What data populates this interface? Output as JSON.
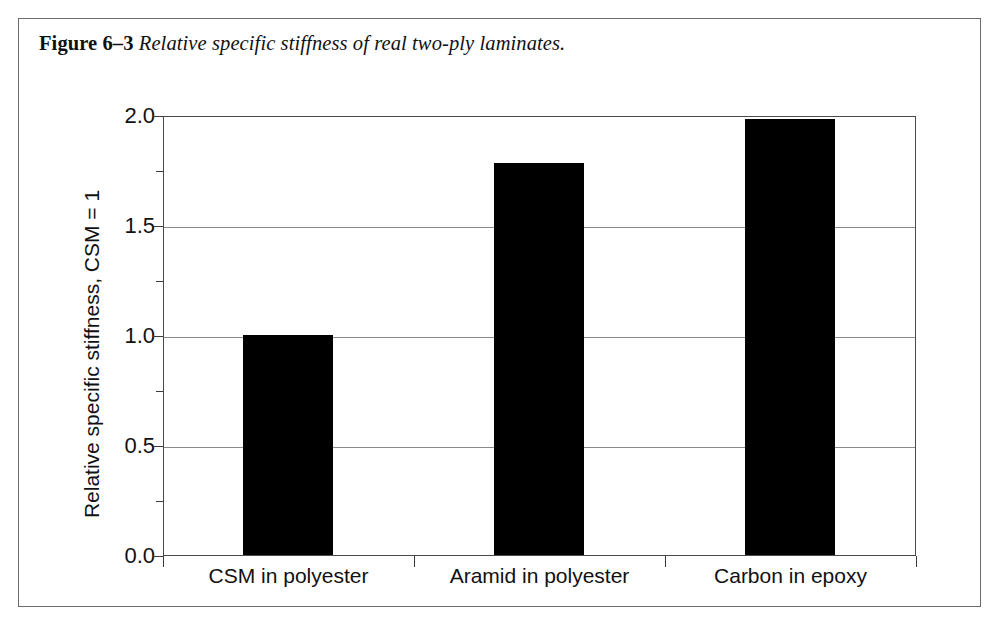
{
  "figure": {
    "caption_label": "Figure 6–3",
    "caption_text": " Relative specific stiffness of real two-ply laminates."
  },
  "chart_data": {
    "type": "bar",
    "title": "",
    "categories": [
      "CSM in polyester",
      "Aramid in polyester",
      "Carbon in epoxy"
    ],
    "values": [
      1.0,
      1.78,
      1.98
    ],
    "xlabel": "",
    "ylabel": "Relative specific stiffness, CSM = 1",
    "ylim": [
      0.0,
      2.0
    ],
    "ytick_labels": [
      "0.0",
      "0.5",
      "1.0",
      "1.5",
      "2.0"
    ],
    "ytick_values": [
      0.0,
      0.5,
      1.0,
      1.5,
      2.0
    ],
    "yminor_tick_values": [
      0.25,
      0.75,
      1.25,
      1.75
    ],
    "grid": true,
    "grid_axis": "y",
    "legend": false,
    "bar_color": "#000000",
    "grid_color": "#8a8a8a",
    "axis_color": "#4a4a4a"
  }
}
